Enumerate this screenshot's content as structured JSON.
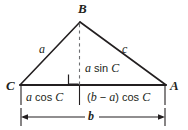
{
  "figure": {
    "kind": "geometry-diagram",
    "colors": {
      "stroke": "#231f20",
      "text": "#231f20",
      "background": "#ffffff",
      "dashed": "#6d6e71"
    },
    "vertices": [
      {
        "name": "B",
        "label": "B",
        "x": 80,
        "y": 22
      },
      {
        "name": "C",
        "label": "C",
        "x": 20,
        "y": 85
      },
      {
        "name": "A",
        "label": "A",
        "x": 166,
        "y": 85
      }
    ],
    "sides": [
      {
        "name": "side-a",
        "label": "a",
        "from": "C",
        "to": "B"
      },
      {
        "name": "side-c",
        "label": "c",
        "from": "B",
        "to": "A"
      }
    ],
    "altitude": {
      "label": "a sin C",
      "foot_x": 79,
      "style": "dashed",
      "right_angle_marker": true
    },
    "segments": [
      {
        "name": "left-segment",
        "label_plain": "a cos C",
        "parts": [
          {
            "t": "a",
            "italic": true
          },
          {
            "t": " cos ",
            "italic": false
          },
          {
            "t": "C",
            "italic": true
          }
        ]
      },
      {
        "name": "right-segment",
        "label_plain": "(b - a) cos C",
        "parts": [
          {
            "t": "(",
            "italic": false
          },
          {
            "t": "b",
            "italic": true
          },
          {
            "t": " − ",
            "italic": false
          },
          {
            "t": "a",
            "italic": true
          },
          {
            "t": ") cos ",
            "italic": false
          },
          {
            "t": "C",
            "italic": true
          }
        ]
      }
    ],
    "dimension": {
      "name": "base-dimension",
      "label": "b",
      "from_x": 21,
      "to_x": 165,
      "y": 117,
      "arrows": "double"
    }
  }
}
